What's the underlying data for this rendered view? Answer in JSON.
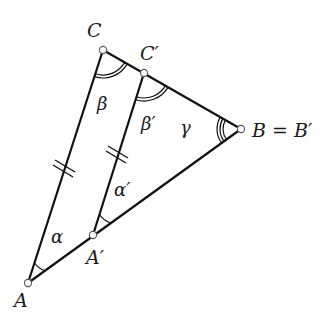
{
  "diagram": {
    "title": "",
    "points": {
      "A": {
        "x": 28,
        "y": 283,
        "label": "A"
      },
      "A_prime": {
        "x": 93,
        "y": 235,
        "label": "A′"
      },
      "B": {
        "x": 241,
        "y": 129,
        "label": "B = B′"
      },
      "C": {
        "x": 103,
        "y": 50,
        "label": "C"
      },
      "C_prime": {
        "x": 144,
        "y": 73,
        "label": "C′"
      }
    },
    "angles": {
      "alpha": "α",
      "alpha_prime": "α′",
      "beta": "β",
      "beta_prime": "β′",
      "gamma": "γ"
    },
    "colors": {
      "line": "#111111",
      "point_fill": "#ffffff",
      "point_stroke": "#555555"
    }
  }
}
